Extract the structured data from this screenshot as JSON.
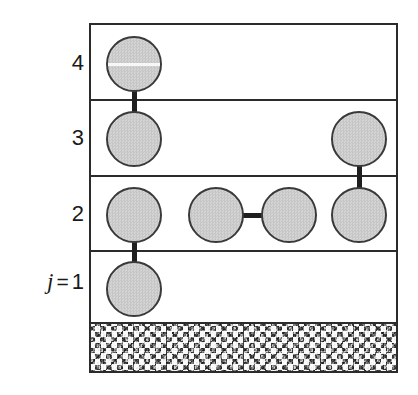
{
  "figure": {
    "background_color": "#ffffff",
    "box": {
      "x": 89,
      "y": 23,
      "width": 309,
      "height": 350,
      "border_color": "#2b2b2b",
      "border_width": 2,
      "fill": "#ffffff"
    }
  },
  "labels": [
    {
      "name": "level-label-4",
      "text": "4",
      "prefix": "",
      "value": "4",
      "x": 40,
      "y": 52,
      "width": 44
    },
    {
      "name": "level-label-3",
      "text": "3",
      "prefix": "",
      "value": "3",
      "x": 40,
      "y": 127,
      "width": 44
    },
    {
      "name": "level-label-2",
      "text": "2",
      "prefix": "",
      "value": "2",
      "x": 40,
      "y": 203,
      "width": 44
    },
    {
      "name": "level-label-1",
      "text": "j = 1",
      "prefix": "j",
      "equals": "=",
      "value": "1",
      "x": 14,
      "y": 270,
      "width": 70
    }
  ],
  "layers": [
    {
      "index": 4,
      "label": "4",
      "top": 23,
      "bottom": 99
    },
    {
      "index": 3,
      "label": "3",
      "top": 99,
      "bottom": 175
    },
    {
      "index": 2,
      "label": "2",
      "top": 175,
      "bottom": 250
    },
    {
      "index": 1,
      "label": "j = 1",
      "top": 250,
      "bottom": 322
    }
  ],
  "dividers": [
    {
      "name": "divider-4-3",
      "y": 74
    },
    {
      "name": "divider-3-2",
      "y": 150
    },
    {
      "name": "divider-2-1",
      "y": 225
    }
  ],
  "substrate": {
    "name": "substrate-hatch",
    "top": 297,
    "height": 51,
    "base_color": "#a8a8a8",
    "description": "speckled granular substrate"
  },
  "atoms": [
    {
      "id": "a4-1",
      "layer": 4,
      "column": 1,
      "cx": 132,
      "cy": 62,
      "r": 28,
      "scanline": true
    },
    {
      "id": "a3-1",
      "layer": 3,
      "column": 1,
      "cx": 132,
      "cy": 137,
      "r": 28,
      "scanline": false
    },
    {
      "id": "a3-4",
      "layer": 3,
      "column": 4,
      "cx": 357,
      "cy": 137,
      "r": 28,
      "scanline": false
    },
    {
      "id": "a2-1",
      "layer": 2,
      "column": 1,
      "cx": 132,
      "cy": 213,
      "r": 28,
      "scanline": false
    },
    {
      "id": "a2-2",
      "layer": 2,
      "column": 2,
      "cx": 214,
      "cy": 213,
      "r": 28,
      "scanline": false
    },
    {
      "id": "a2-3",
      "layer": 2,
      "column": 3,
      "cx": 287,
      "cy": 213,
      "r": 28,
      "scanline": false
    },
    {
      "id": "a2-4",
      "layer": 2,
      "column": 4,
      "cx": 357,
      "cy": 213,
      "r": 28,
      "scanline": false
    },
    {
      "id": "a1-1",
      "layer": 1,
      "column": 1,
      "cx": 132,
      "cy": 287,
      "r": 28,
      "scanline": false
    }
  ],
  "bonds": [
    {
      "id": "b-a4-1_a3-1",
      "orientation": "vertical",
      "from": "a4-1",
      "to": "a3-1",
      "x": 132,
      "y1": 88,
      "y2": 111
    },
    {
      "id": "b-a3-4_a2-4",
      "orientation": "vertical",
      "from": "a3-4",
      "to": "a2-4",
      "x": 357,
      "y1": 163,
      "y2": 187
    },
    {
      "id": "b-a2-1_a1-1",
      "orientation": "vertical",
      "from": "a2-1",
      "to": "a1-1",
      "x": 132,
      "y1": 239,
      "y2": 261
    },
    {
      "id": "b-a2-2_a2-3",
      "orientation": "horizontal",
      "from": "a2-2",
      "to": "a2-3",
      "y": 213,
      "x1": 240,
      "x2": 261
    }
  ],
  "colors": {
    "atom_fill": "#cccccc",
    "atom_stroke": "#3a3a3a",
    "bond": "#1f1f1f",
    "box_stroke": "#2b2b2b",
    "substrate": "#a8a8a8",
    "text": "#1a1a1a",
    "page_background": "#ffffff"
  }
}
